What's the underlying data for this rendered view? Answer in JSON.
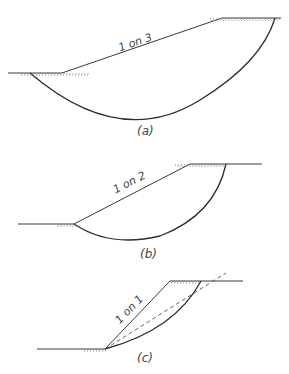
{
  "figures": [
    {
      "id": "a",
      "caption": "(a)",
      "slope_label": "1 on 3"
    },
    {
      "id": "b",
      "caption": "(b)",
      "slope_label": "1 on 2"
    },
    {
      "id": "c",
      "caption": "(c)",
      "slope_label": "1 on 1"
    }
  ],
  "colors": {
    "line": "#3a3a3a",
    "background": "#ffffff"
  }
}
